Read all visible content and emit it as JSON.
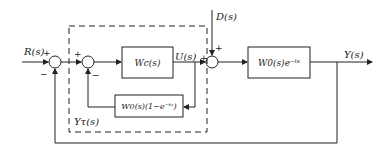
{
  "diagram": {
    "type": "control-block-diagram",
    "signals": {
      "input": "R(s)",
      "disturbance": "D(s)",
      "control": "U(s)",
      "output": "Y(s)",
      "predictor_feedback": "Yτ(s)"
    },
    "blocks": {
      "controller": "Wc(s)",
      "plant": "W0(s)e⁻ᵗˢ",
      "predictor": "W0(s)(1−e⁻ᵗˢ)"
    },
    "signs": {
      "j1_input": "+",
      "j1_feedback": "−",
      "j2_input": "+",
      "j2_feedback": "−",
      "j3_u": "+",
      "j3_d": "+"
    }
  }
}
